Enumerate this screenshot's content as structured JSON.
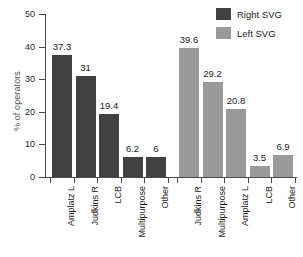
{
  "chart_data": {
    "type": "bar",
    "title": "",
    "xlabel": "",
    "ylabel": "% of operators",
    "ylim": [
      0,
      50
    ],
    "yticks": [
      0,
      10,
      20,
      30,
      40,
      50
    ],
    "ytick_labels": [
      "0",
      "10",
      "20",
      "30",
      "40",
      "50"
    ],
    "grid": false,
    "legend_position": "top-right",
    "groups": [
      {
        "name": "Right SVG",
        "color": "#414141",
        "categories": [
          "Amplatz L",
          "Judkins R",
          "LCB",
          "Multipurpose",
          "Other"
        ],
        "values": [
          37.3,
          31,
          19.4,
          6.2,
          6
        ],
        "value_labels": [
          "37.3",
          "31",
          "19.4",
          "6.2",
          "6"
        ]
      },
      {
        "name": "Left SVG",
        "color": "#9a9a9a",
        "categories": [
          "Judkins R",
          "Multipurpose",
          "Amplatz L",
          "LCB",
          "Other"
        ],
        "values": [
          39.6,
          29.2,
          20.8,
          3.5,
          6.9
        ],
        "value_labels": [
          "39.6",
          "29.2",
          "20.8",
          "3.5",
          "6.9"
        ]
      }
    ]
  },
  "legend": {
    "items": [
      {
        "label": "Right SVG",
        "color": "#414141"
      },
      {
        "label": "Left SVG",
        "color": "#9a9a9a"
      }
    ]
  },
  "axis": {
    "y_label": "% of operators",
    "y_tick_0": "0",
    "y_tick_1": "10",
    "y_tick_2": "20",
    "y_tick_3": "30",
    "y_tick_4": "40",
    "y_tick_5": "50"
  }
}
